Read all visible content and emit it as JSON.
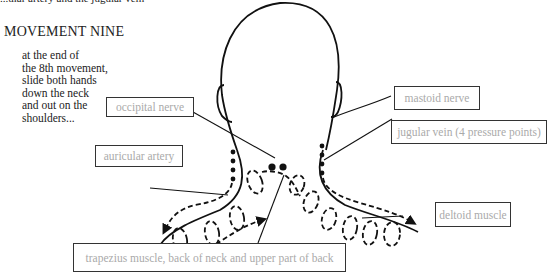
{
  "header_fragment": "...ular artery and the jugular vein",
  "title": "MOVEMENT NINE",
  "instructions": [
    "at the end of",
    "the 8th movement,",
    "slide both hands",
    "down the neck",
    "and out on the",
    "shoulders..."
  ],
  "labels": {
    "occipital_nerve": "occipital nerve",
    "auricular_artery": "auricular artery",
    "mastoid_nerve": "mastoid nerve",
    "jugular_vein": "jugular vein (4 pressure points)",
    "deltoid_muscle": "deltoid muscle",
    "trapezius": "trapezius muscle, back of neck and upper part of back"
  },
  "colors": {
    "line": "#111111",
    "label_text": "#aaaaaa",
    "text": "#222222"
  }
}
